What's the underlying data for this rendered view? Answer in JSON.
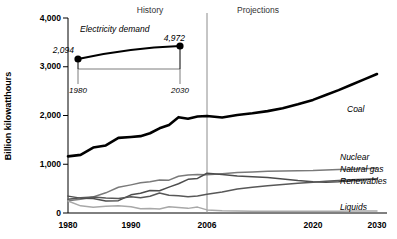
{
  "figure": {
    "ylabel": "Billion kilowatthours",
    "period_history": "History",
    "period_projections": "Projections",
    "divider_year": "2006"
  },
  "inset": {
    "title": "Electricity demand",
    "start_value_label": "2,094",
    "end_value_label": "4,972",
    "start_year_label": "1980",
    "end_year_label": "2030"
  },
  "caption": {
    "text": ""
  },
  "chart_data": {
    "type": "line",
    "title": "",
    "xlabel": "",
    "ylabel": "Billion kilowatthours",
    "ylim": [
      0,
      4000
    ],
    "yticks": [
      0,
      1000,
      2000,
      3000,
      4000
    ],
    "ytick_labels": [
      "0",
      "1,000",
      "2,000",
      "3,000",
      "4,000"
    ],
    "xticks": [
      1980,
      1990,
      2006,
      2020,
      2030
    ],
    "xtick_labels": [
      "1980",
      "1990",
      "2006",
      "2020",
      "2030"
    ],
    "xlim": [
      1980,
      2030
    ],
    "grid": false,
    "legend": "inline-right",
    "annotations": [
      {
        "text": "History",
        "x": 1993,
        "y": 3900
      },
      {
        "text": "Projections",
        "x": 2018,
        "y": 3900
      },
      {
        "text": "2006 divider",
        "x": 2006,
        "y": 4000
      }
    ],
    "series": [
      {
        "name": "Coal",
        "style": "thick-black",
        "color": "#000000",
        "x": [
          1980,
          1982,
          1984,
          1986,
          1988,
          1990,
          1992,
          1994,
          1996,
          1998,
          2000,
          2002,
          2004,
          2006,
          2008,
          2010,
          2012,
          2014,
          2016,
          2018,
          2020,
          2022,
          2024,
          2026,
          2028,
          2030
        ],
        "values": [
          1162,
          1192,
          1342,
          1386,
          1541,
          1560,
          1576,
          1636,
          1737,
          1807,
          1966,
          1933,
          1978,
          1991,
          1960,
          2010,
          2045,
          2090,
          2150,
          2230,
          2320,
          2420,
          2520,
          2630,
          2740,
          2850
        ]
      },
      {
        "name": "Nuclear",
        "style": "medium-gray",
        "color": "#7a7a7a",
        "x": [
          1980,
          1982,
          1984,
          1986,
          1988,
          1990,
          1992,
          1994,
          1996,
          1998,
          2000,
          2002,
          2004,
          2006,
          2008,
          2010,
          2012,
          2014,
          2016,
          2018,
          2020,
          2022,
          2024,
          2026,
          2028,
          2030
        ],
        "values": [
          251,
          283,
          328,
          414,
          527,
          577,
          619,
          640,
          675,
          674,
          754,
          780,
          789,
          787,
          806,
          830,
          840,
          855,
          860,
          865,
          870,
          880,
          890,
          900,
          910,
          920
        ]
      },
      {
        "name": "Natural gas",
        "style": "dark-gray",
        "color": "#4d4d4d",
        "x": [
          1980,
          1982,
          1984,
          1986,
          1988,
          1990,
          1992,
          1994,
          1996,
          1998,
          2000,
          2002,
          2004,
          2006,
          2008,
          2010,
          2012,
          2014,
          2016,
          2018,
          2020,
          2022,
          2024,
          2026,
          2028,
          2030
        ],
        "values": [
          346,
          305,
          297,
          248,
          253,
          373,
          404,
          460,
          456,
          531,
          601,
          691,
          710,
          816,
          790,
          760,
          745,
          730,
          700,
          665,
          640,
          630,
          640,
          660,
          680,
          700
        ]
      },
      {
        "name": "Renewables",
        "style": "dark-gray-2",
        "color": "#585858",
        "x": [
          1980,
          1982,
          1984,
          1986,
          1988,
          1990,
          1992,
          1994,
          1996,
          1998,
          2000,
          2002,
          2004,
          2006,
          2008,
          2010,
          2012,
          2014,
          2016,
          2018,
          2020,
          2022,
          2024,
          2026,
          2028,
          2030
        ],
        "values": [
          284,
          312,
          330,
          310,
          296,
          334,
          313,
          345,
          410,
          365,
          356,
          335,
          350,
          383,
          430,
          490,
          530,
          560,
          585,
          610,
          630,
          650,
          665,
          680,
          690,
          700
        ]
      },
      {
        "name": "Liquids",
        "style": "light-gray",
        "color": "#a8a8a8",
        "x": [
          1980,
          1982,
          1984,
          1986,
          1988,
          1990,
          1992,
          1994,
          1996,
          1998,
          2000,
          2002,
          2004,
          2006,
          2008,
          2010,
          2012,
          2014,
          2016,
          2018,
          2020,
          2022,
          2024,
          2026,
          2028,
          2030
        ],
        "values": [
          246,
          147,
          120,
          137,
          149,
          127,
          89,
          92,
          81,
          129,
          112,
          95,
          121,
          64,
          45,
          40,
          38,
          37,
          36,
          36,
          36,
          37,
          38,
          39,
          40,
          42
        ]
      }
    ],
    "inset_chart": {
      "type": "line",
      "title": "Electricity demand",
      "x": [
        1980,
        2030
      ],
      "values": [
        2094,
        4972
      ],
      "point_labels": [
        "2,094",
        "4,972"
      ],
      "xtick_labels": [
        "1980",
        "2030"
      ]
    }
  }
}
